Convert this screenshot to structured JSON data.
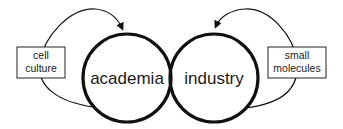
{
  "diagram": {
    "circles": [
      {
        "id": "academia",
        "label": "academia",
        "cx": 127,
        "cy": 78,
        "r": 44
      },
      {
        "id": "industry",
        "label": "industry",
        "cx": 214,
        "cy": 78,
        "r": 44
      }
    ],
    "boxes": [
      {
        "id": "cell-culture",
        "lines": [
          "cell",
          "culture"
        ],
        "x": 17,
        "y": 47,
        "w": 48,
        "h": 31
      },
      {
        "id": "small-molecules",
        "lines": [
          "small",
          "molecules"
        ],
        "x": 268,
        "y": 47,
        "w": 58,
        "h": 31
      }
    ],
    "edges": [
      {
        "from": "academia",
        "via": "cell-culture",
        "to": "academia",
        "arrow": "into top of academia"
      },
      {
        "from": "industry",
        "via": "small-molecules",
        "to": "industry",
        "arrow": "into top of industry"
      }
    ],
    "colors": {
      "stroke": "#111111",
      "text": "#1a1a1a",
      "background": "#ffffff"
    }
  }
}
